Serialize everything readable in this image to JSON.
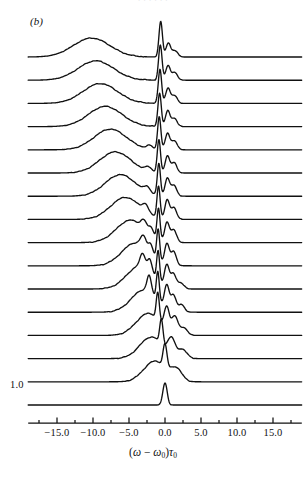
{
  "figure": {
    "panel_label": "(b)",
    "page_bleed_text": "· · · · · ·",
    "scale_bar_label": "1.0"
  },
  "axes": {
    "x_title_parts": {
      "open": "(",
      "omega": "ω",
      "minus": " − ",
      "omega0": "ω",
      "omega0_sub": "0",
      "close": ")",
      "tau": "τ",
      "tau_sub": "0"
    },
    "x_title_plain": "(ω − ω₀)τ₀",
    "x_tick_labels": [
      "−15.0",
      "−10.0",
      "−5.0",
      "0.0",
      "5.0",
      "10.0",
      "15.0"
    ],
    "x_tick_values": [
      -15,
      -10,
      -5,
      0,
      5,
      10,
      15
    ],
    "x_minor_tick_values": [
      -17.5,
      -12.5,
      -7.5,
      -2.5,
      2.5,
      7.5,
      12.5,
      17.5
    ],
    "x_range": [
      -19.0,
      19.0
    ],
    "y_scale_bar_value": 1.0
  },
  "style": {
    "ink": "#111111",
    "paper": "#ffffff",
    "trace_width": 1.35,
    "axis_width": 1.25
  },
  "chart_data": {
    "type": "line",
    "title": "(b)",
    "subtitle": "Stacked (waterfall) spectral traces",
    "xlabel": "(ω − ω₀)τ₀",
    "ylabel": "Spectral intensity (arb. units, offset)",
    "xlim": [
      -19.0,
      19.0
    ],
    "grid": false,
    "legend": false,
    "n_traces": 16,
    "trace_order": "top trace = largest broad-peak red shift; bottom trace = unmodulated single line",
    "stack_offset_px": 23.2,
    "baseline_y_px": [
      57.0,
      80.2,
      103.4,
      126.6,
      149.8,
      173.0,
      196.2,
      219.4,
      242.6,
      265.8,
      289.0,
      312.2,
      335.4,
      358.6,
      381.8,
      405.0
    ],
    "x_axis_px": [
      57.0,
      273.0
    ],
    "x_axis_px_values": [
      -15.0,
      15.0
    ],
    "series": [
      {
        "name": "trace-1",
        "index": 1,
        "broad_peak_center": -10.2,
        "broad_peak_width": 3.6,
        "broad_peak_height": 0.86,
        "sharp_peak_center": -0.6,
        "sharp_peak_width": 0.34,
        "sharp_peak_height": 1.62,
        "sidebands": [
          {
            "c": 0.45,
            "w": 0.45,
            "h": 0.62
          },
          {
            "c": 1.35,
            "w": 0.55,
            "h": 0.3
          }
        ]
      },
      {
        "name": "trace-2",
        "index": 2,
        "broad_peak_center": -9.6,
        "broad_peak_width": 3.5,
        "broad_peak_height": 0.88,
        "sharp_peak_center": -0.65,
        "sharp_peak_width": 0.34,
        "sharp_peak_height": 1.58,
        "sidebands": [
          {
            "c": 0.42,
            "w": 0.45,
            "h": 0.66
          },
          {
            "c": 1.35,
            "w": 0.55,
            "h": 0.34
          }
        ]
      },
      {
        "name": "trace-3",
        "index": 3,
        "broad_peak_center": -9.0,
        "broad_peak_width": 3.4,
        "broad_peak_height": 0.9,
        "sharp_peak_center": -0.7,
        "sharp_peak_width": 0.33,
        "sharp_peak_height": 1.55,
        "sidebands": [
          {
            "c": 0.4,
            "w": 0.45,
            "h": 0.68
          },
          {
            "c": 1.32,
            "w": 0.55,
            "h": 0.36
          }
        ]
      },
      {
        "name": "trace-4",
        "index": 4,
        "broad_peak_center": -8.3,
        "broad_peak_width": 3.3,
        "broad_peak_height": 0.92,
        "sharp_peak_center": -0.75,
        "sharp_peak_width": 0.33,
        "sharp_peak_height": 1.52,
        "sidebands": [
          {
            "c": 0.38,
            "w": 0.45,
            "h": 0.7
          },
          {
            "c": 1.3,
            "w": 0.55,
            "h": 0.38
          }
        ]
      },
      {
        "name": "trace-5",
        "index": 5,
        "broad_peak_center": -7.6,
        "broad_peak_width": 3.2,
        "broad_peak_height": 0.94,
        "sharp_peak_center": -0.8,
        "sharp_peak_width": 0.32,
        "sharp_peak_height": 1.5,
        "sidebands": [
          {
            "c": -2.1,
            "w": 0.6,
            "h": 0.16
          },
          {
            "c": 0.35,
            "w": 0.45,
            "h": 0.74
          },
          {
            "c": 1.28,
            "w": 0.55,
            "h": 0.42
          }
        ]
      },
      {
        "name": "trace-6",
        "index": 6,
        "broad_peak_center": -6.9,
        "broad_peak_width": 3.1,
        "broad_peak_height": 0.96,
        "sharp_peak_center": -0.85,
        "sharp_peak_width": 0.32,
        "sharp_peak_height": 1.48,
        "sidebands": [
          {
            "c": -2.3,
            "w": 0.6,
            "h": 0.2
          },
          {
            "c": 0.33,
            "w": 0.45,
            "h": 0.76
          },
          {
            "c": 1.26,
            "w": 0.55,
            "h": 0.46
          }
        ]
      },
      {
        "name": "trace-7",
        "index": 7,
        "broad_peak_center": -6.2,
        "broad_peak_width": 3.0,
        "broad_peak_height": 0.98,
        "sharp_peak_center": -0.85,
        "sharp_peak_width": 0.31,
        "sharp_peak_height": 1.46,
        "sidebands": [
          {
            "c": -2.5,
            "w": 0.6,
            "h": 0.26
          },
          {
            "c": 0.32,
            "w": 0.45,
            "h": 0.8
          },
          {
            "c": 1.24,
            "w": 0.55,
            "h": 0.5
          }
        ]
      },
      {
        "name": "trace-8",
        "index": 8,
        "broad_peak_center": -5.5,
        "broad_peak_width": 2.9,
        "broad_peak_height": 1.0,
        "sharp_peak_center": -0.9,
        "sharp_peak_width": 0.31,
        "sharp_peak_height": 1.44,
        "sidebands": [
          {
            "c": -2.7,
            "w": 0.6,
            "h": 0.32
          },
          {
            "c": 0.3,
            "w": 0.45,
            "h": 0.84
          },
          {
            "c": 1.22,
            "w": 0.55,
            "h": 0.54
          }
        ]
      },
      {
        "name": "trace-9",
        "index": 9,
        "broad_peak_center": -4.8,
        "broad_peak_width": 2.8,
        "broad_peak_height": 1.02,
        "sharp_peak_center": -0.9,
        "sharp_peak_width": 0.3,
        "sharp_peak_height": 1.42,
        "sidebands": [
          {
            "c": -2.9,
            "w": 0.58,
            "h": 0.4
          },
          {
            "c": -1.9,
            "w": 0.45,
            "h": 0.34
          },
          {
            "c": 0.28,
            "w": 0.45,
            "h": 0.88
          },
          {
            "c": 1.2,
            "w": 0.55,
            "h": 0.58
          }
        ]
      },
      {
        "name": "trace-10",
        "index": 10,
        "broad_peak_center": -4.1,
        "broad_peak_width": 2.7,
        "broad_peak_height": 1.04,
        "sharp_peak_center": -0.95,
        "sharp_peak_width": 0.3,
        "sharp_peak_height": 1.4,
        "sidebands": [
          {
            "c": -3.0,
            "w": 0.55,
            "h": 0.5
          },
          {
            "c": -2.0,
            "w": 0.45,
            "h": 0.44
          },
          {
            "c": 0.26,
            "w": 0.45,
            "h": 0.92
          },
          {
            "c": 1.18,
            "w": 0.55,
            "h": 0.62
          }
        ]
      },
      {
        "name": "trace-11",
        "index": 11,
        "broad_peak_center": -3.5,
        "broad_peak_width": 2.6,
        "broad_peak_height": 1.04,
        "sharp_peak_center": -0.95,
        "sharp_peak_width": 0.29,
        "sharp_peak_height": 1.36,
        "sidebands": [
          {
            "c": -3.1,
            "w": 0.52,
            "h": 0.6
          },
          {
            "c": -2.1,
            "w": 0.45,
            "h": 0.56
          },
          {
            "c": 0.25,
            "w": 0.45,
            "h": 0.96
          },
          {
            "c": 1.16,
            "w": 0.55,
            "h": 0.66
          },
          {
            "c": 2.2,
            "w": 0.6,
            "h": 0.26
          }
        ]
      },
      {
        "name": "trace-12",
        "index": 12,
        "broad_peak_center": -2.9,
        "broad_peak_width": 2.5,
        "broad_peak_height": 1.02,
        "sharp_peak_center": -1.0,
        "sharp_peak_width": 0.29,
        "sharp_peak_height": 1.3,
        "sidebands": [
          {
            "c": -2.2,
            "w": 0.42,
            "h": 0.74
          },
          {
            "c": 0.24,
            "w": 0.45,
            "h": 1.0
          },
          {
            "c": 1.15,
            "w": 0.55,
            "h": 0.72
          },
          {
            "c": 2.3,
            "w": 0.6,
            "h": 0.32
          }
        ]
      },
      {
        "name": "trace-13",
        "index": 13,
        "broad_peak_center": -2.3,
        "broad_peak_width": 2.4,
        "broad_peak_height": 1.0,
        "sharp_peak_center": -1.0,
        "sharp_peak_width": 0.3,
        "sharp_peak_height": 1.22,
        "sidebands": [
          {
            "c": 0.25,
            "w": 0.48,
            "h": 1.0
          },
          {
            "c": 1.35,
            "w": 0.62,
            "h": 0.78
          },
          {
            "c": 2.6,
            "w": 0.7,
            "h": 0.34
          }
        ]
      },
      {
        "name": "trace-14",
        "index": 14,
        "broad_peak_center": -1.9,
        "broad_peak_width": 2.3,
        "broad_peak_height": 0.98,
        "sharp_peak_center": -0.5,
        "sharp_peak_width": 0.32,
        "sharp_peak_height": 1.12,
        "sidebands": [
          {
            "c": 0.9,
            "w": 0.7,
            "h": 0.74
          },
          {
            "c": 2.4,
            "w": 0.9,
            "h": 0.4
          }
        ]
      },
      {
        "name": "trace-15",
        "index": 15,
        "broad_peak_center": -1.4,
        "broad_peak_width": 2.2,
        "broad_peak_height": 0.94,
        "sharp_peak_center": 0.0,
        "sharp_peak_width": 0.38,
        "sharp_peak_height": 1.05,
        "sidebands": [
          {
            "c": 1.6,
            "w": 1.1,
            "h": 0.52
          }
        ]
      },
      {
        "name": "trace-16",
        "index": 16,
        "broad_peak_center": null,
        "broad_peak_width": null,
        "broad_peak_height": 0.0,
        "sharp_peak_center": 0.0,
        "sharp_peak_width": 0.42,
        "sharp_peak_height": 1.0,
        "sidebands": []
      }
    ]
  }
}
